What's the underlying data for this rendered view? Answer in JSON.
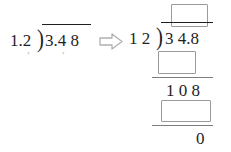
{
  "problem": {
    "left": {
      "divisor": "1.2",
      "dividend": "3.4 8",
      "bracket_glyph": ")",
      "caret_divisor": ",",
      "caret_dividend": ",",
      "label": "1.2 ) 3.4 8"
    },
    "arrow": {
      "glyph": "arrow-right-outline",
      "color": "#b0b0b0"
    },
    "right": {
      "divisor": "1 2",
      "dividend": "3 4.8",
      "bracket_glyph": ")",
      "quotient": "",
      "partial_product_1": "",
      "remainder_1": "1 0 8",
      "partial_product_2": "",
      "final_remainder": "0",
      "label": "12 ) 34.8"
    }
  },
  "colors": {
    "ink": "#1f1f1f",
    "rule": "#7d7d7d",
    "box_border": "#9a9a9a",
    "caret": "#b9b9b9",
    "background": "#ffffff"
  }
}
